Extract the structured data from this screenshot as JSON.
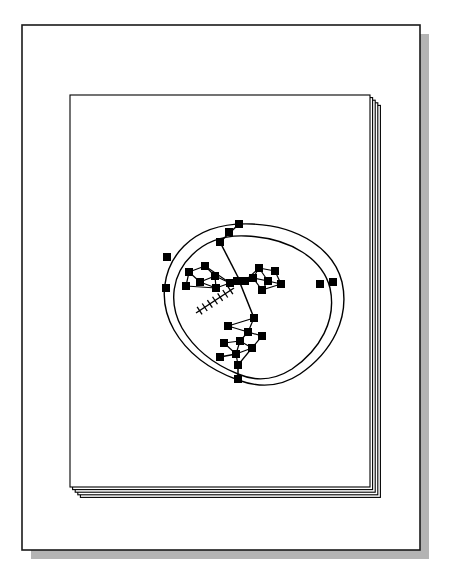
{
  "document": {
    "kind": "scanned-technical-figure",
    "title": "Stacked page frames with central node-link graph",
    "background_color": "#ffffff",
    "ink_color": "#000000",
    "shadow_color": "#b4b4b4"
  },
  "outer_frame": {
    "name": "outer-page-border",
    "x": 22,
    "y": 25,
    "width": 398,
    "height": 525,
    "stroke_color": "#1a1a1a",
    "stroke_width": 1.6,
    "fill_color": "#ffffff",
    "shadow": {
      "offset_x": 9,
      "offset_y": 9,
      "color": "#b4b4b4"
    }
  },
  "page_stack": {
    "name": "nested-page-stack",
    "count": 5,
    "base_x": 70,
    "base_y": 95,
    "base_width": 300,
    "base_height": 392,
    "offset_step_x": 2.6,
    "offset_step_y": 2.6,
    "stroke_color": "#000000",
    "stroke_width": 1.1,
    "fill_color": "#ffffff"
  },
  "graph": {
    "name": "central-node-link-graph",
    "node_shape": "square",
    "node_color": "#000000",
    "edge_color": "#000000",
    "edge_width": 1.2,
    "node_size_large": 8,
    "node_size_small": 6,
    "center": {
      "x": 240,
      "y": 300
    },
    "contours": [
      {
        "name": "outer-contour",
        "path": "M 252 224 C 300 226 334 250 342 282 C 350 318 332 352 300 374 C 276 390 254 386 238 380 C 216 372 190 358 174 330 C 158 302 162 268 184 246 C 202 228 228 223 252 224 Z"
      },
      {
        "name": "inner-contour",
        "path": "M 246 236 C 292 238 323 260 330 288 C 337 320 320 350 292 369 C 270 383 252 380 238 374 C 218 366 196 352 182 328 C 168 303 172 274 192 255 C 208 239 226 235 246 236 Z"
      }
    ],
    "contour_nodes": [
      {
        "name": "node-top-apex",
        "x": 239,
        "y": 224
      },
      {
        "name": "node-top-inner",
        "x": 229,
        "y": 232
      },
      {
        "name": "node-upper-left-spine",
        "x": 220,
        "y": 242
      },
      {
        "name": "node-left-outer-upper",
        "x": 167,
        "y": 257
      },
      {
        "name": "node-left-outer-lower",
        "x": 166,
        "y": 288
      },
      {
        "name": "node-right-outer",
        "x": 333,
        "y": 282
      },
      {
        "name": "node-right-inner",
        "x": 320,
        "y": 284
      },
      {
        "name": "node-bottom-apex",
        "x": 238,
        "y": 379
      },
      {
        "name": "node-lower-left-rim",
        "x": 220,
        "y": 357
      }
    ],
    "cluster_upper_left": {
      "name": "upper-left-lattice",
      "nodes": [
        {
          "name": "ul-n1",
          "x": 205,
          "y": 266
        },
        {
          "name": "ul-n2",
          "x": 189,
          "y": 272
        },
        {
          "name": "ul-n3",
          "x": 215,
          "y": 276
        },
        {
          "name": "ul-n4",
          "x": 200,
          "y": 282
        },
        {
          "name": "ul-n5",
          "x": 186,
          "y": 286
        },
        {
          "name": "ul-n6",
          "x": 216,
          "y": 288
        },
        {
          "name": "ul-n7",
          "x": 230,
          "y": 283
        },
        {
          "name": "ul-hub",
          "x": 237,
          "y": 281
        }
      ],
      "edges": [
        [
          "ul-n2",
          "ul-n1"
        ],
        [
          "ul-n1",
          "ul-n3"
        ],
        [
          "ul-n3",
          "ul-n6"
        ],
        [
          "ul-n6",
          "ul-n5"
        ],
        [
          "ul-n5",
          "ul-n2"
        ],
        [
          "ul-n2",
          "ul-n4"
        ],
        [
          "ul-n4",
          "ul-n3"
        ],
        [
          "ul-n4",
          "ul-n6"
        ],
        [
          "ul-n1",
          "ul-n7"
        ],
        [
          "ul-n3",
          "ul-n7"
        ],
        [
          "ul-n6",
          "ul-n7"
        ],
        [
          "ul-n7",
          "ul-hub"
        ]
      ]
    },
    "cluster_upper_right": {
      "name": "upper-right-lattice",
      "nodes": [
        {
          "name": "ur-n1",
          "x": 259,
          "y": 268
        },
        {
          "name": "ur-n2",
          "x": 275,
          "y": 271
        },
        {
          "name": "ur-n3",
          "x": 253,
          "y": 278
        },
        {
          "name": "ur-n4",
          "x": 268,
          "y": 281
        },
        {
          "name": "ur-n5",
          "x": 281,
          "y": 284
        },
        {
          "name": "ur-n6",
          "x": 262,
          "y": 290
        },
        {
          "name": "ur-hub",
          "x": 245,
          "y": 281
        }
      ],
      "edges": [
        [
          "ur-hub",
          "ur-n3"
        ],
        [
          "ur-n3",
          "ur-n1"
        ],
        [
          "ur-n1",
          "ur-n2"
        ],
        [
          "ur-n2",
          "ur-n5"
        ],
        [
          "ur-n5",
          "ur-n4"
        ],
        [
          "ur-n4",
          "ur-n3"
        ],
        [
          "ur-n4",
          "ur-n6"
        ],
        [
          "ur-n6",
          "ur-n3"
        ],
        [
          "ur-hub",
          "ur-n1"
        ],
        [
          "ur-n1",
          "ur-n4"
        ],
        [
          "ur-n5",
          "ur-n6"
        ]
      ]
    },
    "cluster_lower": {
      "name": "lower-lattice",
      "nodes": [
        {
          "name": "lo-n1",
          "x": 254,
          "y": 318
        },
        {
          "name": "lo-n2",
          "x": 228,
          "y": 326
        },
        {
          "name": "lo-n3",
          "x": 248,
          "y": 332
        },
        {
          "name": "lo-n4",
          "x": 262,
          "y": 336
        },
        {
          "name": "lo-n5",
          "x": 240,
          "y": 341
        },
        {
          "name": "lo-n6",
          "x": 224,
          "y": 343
        },
        {
          "name": "lo-n7",
          "x": 252,
          "y": 348
        },
        {
          "name": "lo-n8",
          "x": 236,
          "y": 354
        },
        {
          "name": "lo-n9",
          "x": 238,
          "y": 365
        }
      ],
      "edges": [
        [
          "lo-n1",
          "lo-n2"
        ],
        [
          "lo-n2",
          "lo-n3"
        ],
        [
          "lo-n1",
          "lo-n3"
        ],
        [
          "lo-n3",
          "lo-n4"
        ],
        [
          "lo-n4",
          "lo-n7"
        ],
        [
          "lo-n3",
          "lo-n5"
        ],
        [
          "lo-n5",
          "lo-n6"
        ],
        [
          "lo-n5",
          "lo-n7"
        ],
        [
          "lo-n7",
          "lo-n8"
        ],
        [
          "lo-n8",
          "lo-n6"
        ],
        [
          "lo-n8",
          "lo-n9"
        ],
        [
          "lo-n5",
          "lo-n8"
        ],
        [
          "lo-n9",
          "lo-n7"
        ]
      ]
    },
    "spine_edges": [
      {
        "name": "spine-top-to-hub",
        "from": [
          239,
          224
        ],
        "to": [
          220,
          242
        ]
      },
      {
        "name": "spine-upper-to-center",
        "from": [
          220,
          242
        ],
        "to": [
          240,
          281
        ]
      },
      {
        "name": "spine-center-to-lower",
        "from": [
          240,
          283
        ],
        "to": [
          254,
          318
        ]
      },
      {
        "name": "spine-lower-to-bottom",
        "from": [
          238,
          365
        ],
        "to": [
          238,
          379
        ]
      },
      {
        "name": "spine-left-rim-to-cluster",
        "from": [
          220,
          357
        ],
        "to": [
          236,
          354
        ]
      }
    ],
    "hatched_connector": {
      "name": "hatched-ladder-edge",
      "from": [
        234,
        288
      ],
      "to": [
        196,
        313
      ],
      "tick_count": 7,
      "tick_length": 9,
      "description": "cross-hatched tick-marked connector descending to the lower-left"
    }
  }
}
